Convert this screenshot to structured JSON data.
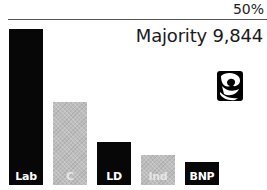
{
  "chart_data": {
    "type": "bar",
    "title": "",
    "subtitle": "Majority 9,844",
    "categories": [
      "Lab",
      "C",
      "LD",
      "Ind",
      "BNP"
    ],
    "values": [
      47,
      25,
      13,
      9,
      7
    ],
    "reference_line": {
      "value": 50,
      "label": "50%"
    },
    "xlabel": "",
    "ylabel": "",
    "ylim": [
      0,
      50
    ],
    "grid": false,
    "legend": "none",
    "colors": [
      "#070707",
      "#bdbdbd",
      "#070707",
      "#bdbdbd",
      "#070707"
    ]
  },
  "header": {
    "reference_label": "50%",
    "majority_text": "Majority 9,844"
  },
  "logo": {
    "icon": "labour-rose-icon"
  },
  "bars": [
    {
      "label": "Lab",
      "value": 47,
      "style": "dark"
    },
    {
      "label": "C",
      "value": 25,
      "style": "light"
    },
    {
      "label": "LD",
      "value": 13,
      "style": "dark"
    },
    {
      "label": "Ind",
      "value": 9,
      "style": "light"
    },
    {
      "label": "BNP",
      "value": 7,
      "style": "dark"
    }
  ]
}
